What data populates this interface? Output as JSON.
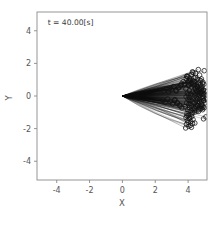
{
  "figure": {
    "background_color": "#ffffff",
    "frame_color": "#8a8a8a",
    "data_color": "#0d0d0d"
  },
  "annotation": {
    "label": "t = 40.00[s]",
    "x_data": -4.55,
    "y_data": 4.35
  },
  "caption": {
    "text": ""
  },
  "chart_data": {
    "type": "scatter",
    "title": "",
    "subtitle": "",
    "xlabel": "X",
    "ylabel": "Y",
    "xlim": [
      -5.2,
      5.15
    ],
    "ylim": [
      -5.15,
      5.15
    ],
    "xticks": [
      -4,
      -2,
      0,
      2,
      4
    ],
    "xticklabels": [
      "-4",
      "-2",
      "0",
      "2",
      "4"
    ],
    "yticks": [
      -4,
      -2,
      0,
      2,
      4
    ],
    "yticklabels": [
      "-4",
      "-2",
      "0",
      "2",
      "4"
    ],
    "grid": false,
    "legend": null,
    "annotations": [
      {
        "text": "t = 40.00[s]",
        "x": -4.55,
        "y": 4.35
      }
    ],
    "marker": {
      "shape": "circle",
      "filled": false,
      "size_px": 4.6,
      "edge_color": "#111111"
    },
    "line": {
      "color": "#0d0d0d",
      "width_px": 0.45
    },
    "origin": {
      "x": 0.0,
      "y": 0.0
    },
    "series": [
      {
        "name": "trajectories",
        "n_points": 220,
        "endpoints_x": [
          4.62,
          4.26,
          4.98,
          3.92,
          4.45,
          4.81,
          4.12,
          4.7,
          3.78,
          4.35,
          4.9,
          4.04,
          4.55,
          4.19,
          4.76,
          3.86,
          4.41,
          4.96,
          4.08,
          4.63,
          4.28,
          4.85,
          3.95,
          4.5,
          4.72,
          4.15,
          4.38,
          4.93,
          4.01,
          4.58,
          4.23,
          4.79,
          3.88,
          4.44,
          4.87,
          4.1,
          4.66,
          4.31,
          4.74,
          3.99,
          4.52,
          4.17,
          4.95,
          4.06,
          4.61,
          4.26,
          4.83,
          3.91,
          4.47,
          4.69,
          4.13,
          4.36,
          4.91,
          4.03,
          4.56,
          4.21,
          4.78,
          3.84,
          4.42,
          4.89,
          4.09,
          4.64,
          4.29,
          4.71,
          3.97,
          4.53,
          4.18,
          4.94,
          4.05,
          4.6,
          4.25,
          4.82,
          3.93,
          4.48,
          4.67,
          4.11,
          4.34,
          4.97,
          4.02,
          4.57,
          4.22,
          4.8,
          3.87,
          4.43,
          4.86,
          4.07,
          4.65,
          4.3,
          4.73,
          3.96,
          4.51,
          4.16,
          4.92,
          4.0,
          4.59,
          4.27,
          4.84,
          3.9,
          4.46,
          4.68,
          4.14,
          4.37,
          4.99,
          4.04,
          4.54,
          4.2,
          4.77,
          3.85,
          4.4,
          4.88,
          5.05,
          5.12,
          4.95,
          5.08,
          3.7,
          3.62,
          3.55,
          3.48,
          3.4,
          3.33,
          3.25,
          3.18,
          3.6,
          3.52,
          3.44,
          3.36,
          3.28,
          3.2,
          3.12,
          3.05,
          2.98,
          2.9,
          2.82,
          2.75,
          2.68,
          2.6,
          2.52,
          2.45,
          2.38,
          2.3,
          2.22,
          2.15,
          2.08,
          2.0,
          1.92,
          1.85,
          1.78,
          1.7,
          1.62,
          1.55,
          1.48,
          1.4,
          1.32,
          1.25,
          1.18,
          1.1,
          1.02,
          0.95,
          0.88,
          0.8,
          0.72,
          0.65,
          0.58,
          0.5,
          0.42,
          0.35,
          0.28,
          0.2,
          4.44,
          4.66,
          4.21,
          4.88,
          4.09,
          4.33,
          4.75,
          3.99,
          4.57,
          4.26,
          4.81,
          3.94,
          4.49,
          4.7,
          4.12,
          4.35,
          4.92,
          4.02,
          4.55,
          4.24,
          4.79,
          3.89,
          4.45,
          4.84,
          4.06,
          4.62,
          4.32,
          4.72,
          3.98,
          4.5,
          4.19,
          4.96,
          4.03,
          4.58,
          4.23,
          4.83,
          3.92,
          4.47,
          4.64,
          4.1,
          4.39,
          4.94,
          5.1,
          4.3,
          3.75,
          2.85,
          1.95,
          1.05,
          0.6,
          0.3,
          5.02,
          4.41
        ],
        "endpoints_y": [
          1.62,
          1.48,
          1.55,
          1.2,
          1.38,
          1.05,
          0.92,
          1.28,
          0.78,
          1.12,
          0.85,
          0.66,
          1.02,
          0.55,
          0.95,
          0.44,
          0.88,
          0.72,
          0.33,
          0.8,
          0.25,
          0.6,
          0.18,
          0.7,
          0.48,
          0.12,
          0.62,
          0.38,
          0.06,
          0.52,
          0.02,
          0.42,
          -0.05,
          0.46,
          0.28,
          -0.1,
          0.36,
          -0.15,
          0.22,
          -0.2,
          0.32,
          -0.26,
          0.16,
          -0.3,
          0.24,
          -0.36,
          0.1,
          -0.42,
          0.18,
          0.04,
          -0.48,
          0.14,
          -0.02,
          -0.54,
          0.08,
          -0.6,
          -0.08,
          -0.66,
          0.0,
          -0.14,
          -0.72,
          -0.04,
          -0.78,
          -0.2,
          -0.84,
          -0.12,
          -0.9,
          -0.26,
          -0.96,
          -0.18,
          -1.02,
          -0.32,
          -1.08,
          -0.24,
          -0.38,
          -1.14,
          -0.44,
          -0.3,
          -1.2,
          -0.36,
          -1.26,
          -0.5,
          -1.32,
          -0.42,
          -0.56,
          -1.38,
          -0.48,
          -1.44,
          -0.62,
          -1.5,
          -0.54,
          -1.56,
          -0.68,
          -1.62,
          -0.6,
          -1.68,
          -0.74,
          -1.74,
          -0.66,
          -0.8,
          -1.8,
          -0.86,
          -0.72,
          -1.86,
          -0.92,
          -1.92,
          -0.78,
          -1.96,
          -0.98,
          -0.84,
          0.3,
          0.05,
          -0.25,
          -1.28,
          0.88,
          -0.72,
          0.64,
          -0.56,
          0.48,
          -0.4,
          0.36,
          -0.28,
          0.74,
          -0.62,
          0.52,
          -0.44,
          0.3,
          -0.22,
          0.58,
          -0.48,
          0.4,
          -0.34,
          0.26,
          -0.18,
          0.44,
          -0.38,
          0.3,
          -0.24,
          0.16,
          -0.12,
          0.34,
          -0.28,
          0.2,
          -0.15,
          0.26,
          -0.21,
          0.14,
          -0.1,
          0.19,
          -0.16,
          0.11,
          -0.08,
          0.14,
          -0.12,
          0.08,
          -0.06,
          0.1,
          -0.09,
          0.06,
          -0.04,
          0.07,
          -0.06,
          0.04,
          -0.03,
          0.05,
          -0.04,
          0.02,
          -0.02,
          1.15,
          0.98,
          1.32,
          0.76,
          1.08,
          0.88,
          0.68,
          1.18,
          0.58,
          0.96,
          0.5,
          1.22,
          0.64,
          0.42,
          1.02,
          0.74,
          0.34,
          0.9,
          0.56,
          0.82,
          0.26,
          1.06,
          0.46,
          0.2,
          0.94,
          0.38,
          0.68,
          0.14,
          0.84,
          0.3,
          0.76,
          0.08,
          0.66,
          -0.56,
          -1.1,
          -0.66,
          -1.22,
          -0.86,
          -0.94,
          -1.34,
          -0.76,
          -1.4,
          -0.18,
          1.45,
          0.7,
          0.42,
          0.22,
          0.1,
          0.06,
          0.02,
          -0.42,
          -1.66
        ]
      }
    ]
  }
}
